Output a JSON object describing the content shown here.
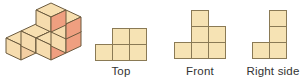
{
  "figure": {
    "kind": "orthographic-projection-diagram",
    "colors": {
      "face_top": "#f7dfb0",
      "face_left": "#f6dcae",
      "face_right": "#ef9f80",
      "outline": "#6b5a3e",
      "view_fill": "#f6e3b4",
      "view_stroke": "#8a7a55",
      "label_text": "#333333",
      "background": "#ffffff"
    },
    "solid": {
      "name": "isometric-cube-stack",
      "cube_count": 7,
      "cubes": [
        {
          "x": 0,
          "y": 0,
          "z": 0
        },
        {
          "x": 1,
          "y": 0,
          "z": 0
        },
        {
          "x": 2,
          "y": 0,
          "z": 0
        },
        {
          "x": 2,
          "y": 1,
          "z": 0
        },
        {
          "x": 1,
          "y": 1,
          "z": 0
        },
        {
          "x": 2,
          "y": 1,
          "z": 1
        },
        {
          "x": 2,
          "y": 1,
          "z": 2
        }
      ]
    },
    "views": [
      {
        "id": "top",
        "label": "Top",
        "rows": 2,
        "cols": 3,
        "grid": [
          [
            0,
            1,
            1
          ],
          [
            1,
            1,
            1
          ]
        ],
        "cell_count": 5
      },
      {
        "id": "front",
        "label": "Front",
        "rows": 3,
        "cols": 3,
        "grid": [
          [
            0,
            1,
            0
          ],
          [
            0,
            1,
            1
          ],
          [
            1,
            1,
            1
          ]
        ],
        "cell_count": 6
      },
      {
        "id": "right-side",
        "label": "Right side",
        "rows": 3,
        "cols": 2,
        "grid": [
          [
            0,
            1
          ],
          [
            0,
            1
          ],
          [
            1,
            1
          ]
        ],
        "cell_count": 4
      }
    ]
  }
}
